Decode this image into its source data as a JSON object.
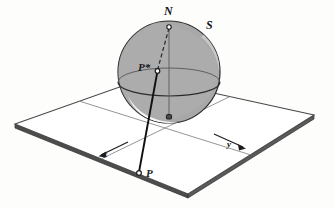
{
  "figure": {
    "background_color": "#fdfdfc",
    "labels": {
      "north_pole": "N",
      "sphere": "S",
      "point_on_sphere": "P*",
      "point_on_plane": "P",
      "axis_x": "x",
      "axis_y": "y"
    },
    "colors": {
      "sphere_fill": "#a8a8a8",
      "sphere_lower_fill": "#9a9a9a",
      "sphere_outline": "#2b2b2b",
      "highlight": "#f2f2f0",
      "plane_fill": "#ffffff",
      "plane_outline": "#4a4a4a",
      "plane_edge_dark": "#3a3a3a",
      "projection_line": "#111111",
      "axis_line": "#6e6e6e",
      "label_color": "#17171a"
    },
    "geometry": {
      "plane_corners": [
        {
          "name": "left",
          "x": 15,
          "y": 124
        },
        {
          "name": "top",
          "x": 145,
          "y": 78
        },
        {
          "name": "right",
          "x": 314,
          "y": 115
        },
        {
          "name": "bottom",
          "x": 188,
          "y": 194
        }
      ],
      "plane_thickness_px": 4,
      "sphere_center": {
        "x": 169,
        "y": 72
      },
      "sphere_radius": 51,
      "north_pole_marker": {
        "x": 169,
        "y": 27
      },
      "south_pole_marker": {
        "x": 169,
        "y": 117
      },
      "p_star_marker": {
        "x": 157,
        "y": 71
      },
      "p_marker": {
        "x": 139,
        "y": 173
      },
      "equator_ellipse": {
        "cx": 169,
        "cy": 82,
        "rx": 51,
        "ry": 14
      },
      "axis_x_arrow": {
        "from": {
          "x": 126,
          "y": 143
        },
        "to": {
          "x": 99,
          "y": 156
        }
      },
      "axis_y_arrow": {
        "from": {
          "x": 215,
          "y": 135
        },
        "to": {
          "x": 245,
          "y": 148
        }
      }
    }
  }
}
